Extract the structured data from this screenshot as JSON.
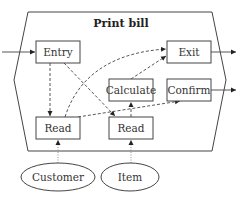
{
  "diagram": {
    "title": "Print bill",
    "nodes": [
      {
        "id": "entry",
        "label": "Entry",
        "shape": "rect"
      },
      {
        "id": "exit",
        "label": "Exit",
        "shape": "rect"
      },
      {
        "id": "calculate",
        "label": "Calculate",
        "shape": "rect"
      },
      {
        "id": "confirm",
        "label": "Confirm",
        "shape": "rect"
      },
      {
        "id": "read_customer",
        "label": "Read",
        "shape": "rect"
      },
      {
        "id": "read_item",
        "label": "Read",
        "shape": "rect"
      },
      {
        "id": "customer",
        "label": "Customer",
        "shape": "ellipse"
      },
      {
        "id": "item",
        "label": "Item",
        "shape": "ellipse"
      }
    ],
    "edges": [
      {
        "from": "external",
        "to": "entry",
        "style": "solid"
      },
      {
        "from": "exit",
        "to": "external",
        "style": "solid"
      },
      {
        "from": "confirm",
        "to": "external",
        "style": "solid"
      },
      {
        "from": "entry",
        "to": "read_customer",
        "style": "dashed"
      },
      {
        "from": "entry",
        "to": "read_item",
        "style": "dashed"
      },
      {
        "from": "read_customer",
        "to": "exit",
        "style": "dashed"
      },
      {
        "from": "calculate",
        "to": "exit",
        "style": "dashed"
      },
      {
        "from": "read_customer",
        "to": "confirm",
        "style": "dashed"
      },
      {
        "from": "read_item",
        "to": "calculate",
        "style": "dashed"
      },
      {
        "from": "customer",
        "to": "read_customer",
        "style": "dotted"
      },
      {
        "from": "item",
        "to": "read_item",
        "style": "dotted"
      }
    ]
  },
  "labels": {
    "title": "Print bill",
    "entry": "Entry",
    "exit": "Exit",
    "calculate": "Calculate",
    "confirm": "Confirm",
    "read_customer": "Read",
    "read_item": "Read",
    "customer": "Customer",
    "item": "Item"
  }
}
